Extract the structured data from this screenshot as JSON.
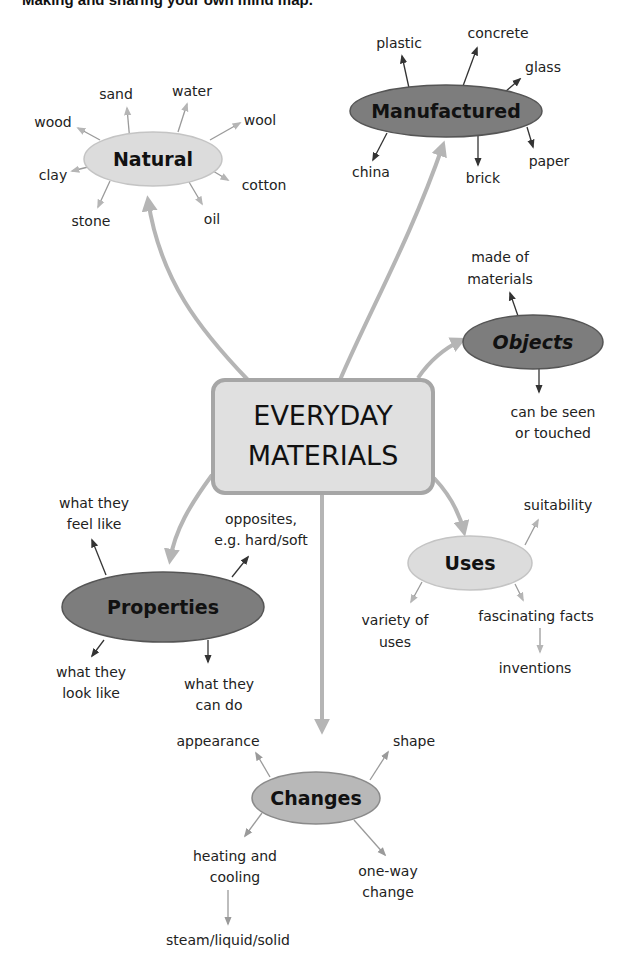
{
  "page": {
    "title_partial": "Making and sharing your own mind map."
  },
  "center": {
    "line1": "EVERYDAY",
    "line2": "MATERIALS"
  },
  "nodes": {
    "natural": {
      "label": "Natural",
      "children": [
        "sand",
        "water",
        "wood",
        "wool",
        "clay",
        "cotton",
        "stone",
        "oil"
      ]
    },
    "manufactured": {
      "label": "Manufactured",
      "children": [
        "plastic",
        "concrete",
        "glass",
        "china",
        "brick",
        "paper"
      ]
    },
    "objects": {
      "label": "Objects",
      "children": [
        "made of materials",
        "can be seen or touched"
      ],
      "child_lines": [
        [
          "made of",
          "materials"
        ],
        [
          "can be seen",
          "or touched"
        ]
      ]
    },
    "properties": {
      "label": "Properties",
      "children": [
        "what they feel like",
        "opposites, e.g. hard/soft",
        "what they look like",
        "what they can do"
      ],
      "child_lines": [
        [
          "what they",
          "feel like"
        ],
        [
          "opposites,",
          "e.g. hard/soft"
        ],
        [
          "what they",
          "look like"
        ],
        [
          "what they",
          "can do"
        ]
      ]
    },
    "uses": {
      "label": "Uses",
      "children": [
        "suitability",
        "variety of uses",
        "fascinating facts",
        "inventions"
      ],
      "child_lines": [
        [
          "suitability"
        ],
        [
          "variety of",
          "uses"
        ],
        [
          "fascinating facts"
        ],
        [
          "inventions"
        ]
      ]
    },
    "changes": {
      "label": "Changes",
      "children": [
        "appearance",
        "shape",
        "heating and cooling",
        "one-way change",
        "steam/liquid/solid"
      ],
      "child_lines": [
        [
          "appearance"
        ],
        [
          "shape"
        ],
        [
          "heating and",
          "cooling"
        ],
        [
          "one-way",
          "change"
        ],
        [
          "steam/liquid/solid"
        ]
      ]
    }
  },
  "colors": {
    "light_fill": "#dcdcdc",
    "dark_fill": "#7d7d7d",
    "mid_fill": "#b8b8b8",
    "center_fill": "#e0e0e0",
    "center_border": "#a6a6a6",
    "connector": "#b5b5b5"
  }
}
